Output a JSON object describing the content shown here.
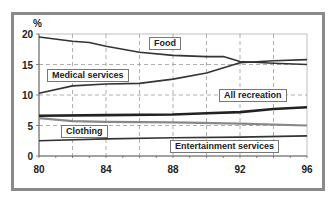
{
  "chart_data": {
    "type": "line",
    "title": "",
    "xlabel": "",
    "ylabel": "%",
    "xlim": [
      80,
      96
    ],
    "ylim": [
      0,
      20
    ],
    "x_ticks": [
      "80",
      "84",
      "88",
      "92",
      "96"
    ],
    "y_ticks": [
      "0",
      "5",
      "10",
      "15",
      "20"
    ],
    "grid": true,
    "legend_position": "inline labels",
    "series": [
      {
        "name": "Food",
        "x": [
          80,
          82,
          83,
          84,
          86,
          88,
          90,
          91,
          92,
          94,
          96
        ],
        "values": [
          19.5,
          18.8,
          18.6,
          18.0,
          17.0,
          16.5,
          16.3,
          16.3,
          15.5,
          15.2,
          15.0
        ],
        "color": "#333333"
      },
      {
        "name": "Medical services",
        "x": [
          80,
          82,
          84,
          86,
          88,
          90,
          92,
          94,
          96
        ],
        "values": [
          10.3,
          11.5,
          11.8,
          11.9,
          12.6,
          13.6,
          15.3,
          15.6,
          15.8
        ],
        "color": "#333333"
      },
      {
        "name": "All recreation",
        "x": [
          80,
          84,
          88,
          90,
          92,
          94,
          96
        ],
        "values": [
          6.6,
          6.7,
          6.8,
          7.0,
          7.2,
          7.7,
          8.0
        ],
        "color": "#222222"
      },
      {
        "name": "Clothing",
        "x": [
          80,
          82,
          84,
          88,
          92,
          96
        ],
        "values": [
          6.2,
          5.7,
          5.6,
          5.5,
          5.3,
          5.0
        ],
        "color": "#888888"
      },
      {
        "name": "Entertainment services",
        "x": [
          80,
          84,
          88,
          92,
          96
        ],
        "values": [
          2.5,
          2.8,
          3.0,
          3.1,
          3.3
        ],
        "color": "#333333"
      }
    ]
  },
  "labels": {
    "y_unit": "%",
    "food": "Food",
    "medical": "Medical services",
    "recreation": "All recreation",
    "clothing": "Clothing",
    "entertainment": "Entertainment services"
  }
}
